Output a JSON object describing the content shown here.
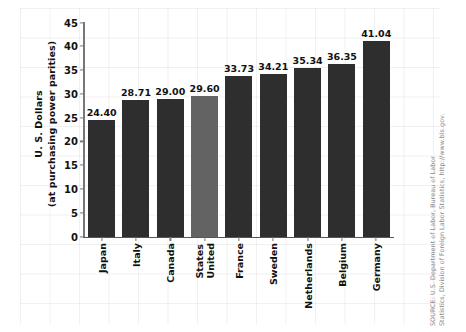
{
  "chart_data": {
    "type": "bar",
    "title": "",
    "xlabel": "",
    "ylabel": "U. S. Dollars (at purchasing power parities)",
    "ylabel_line1": "U. S. Dollars",
    "ylabel_line2": "(at purchasing power parities)",
    "categories": [
      "Japan",
      "Italy",
      "Canada",
      "United States",
      "France",
      "Sweden",
      "Netherlands",
      "Belgium",
      "Germany"
    ],
    "category_lines": [
      [
        "Japan"
      ],
      [
        "Italy"
      ],
      [
        "Canada"
      ],
      [
        "United",
        "States"
      ],
      [
        "France"
      ],
      [
        "Sweden"
      ],
      [
        "Netherlands"
      ],
      [
        "Belgium"
      ],
      [
        "Germany"
      ]
    ],
    "values": [
      24.4,
      28.71,
      29.0,
      29.6,
      33.73,
      34.21,
      35.34,
      36.35,
      41.04
    ],
    "value_labels": [
      "24.40",
      "28.71",
      "29.00",
      "29.60",
      "33.73",
      "34.21",
      "35.34",
      "36.35",
      "41.04"
    ],
    "ylim": [
      0,
      45
    ],
    "yticks": [
      0,
      5,
      10,
      15,
      20,
      25,
      30,
      35,
      40,
      45
    ],
    "ytick_labels": [
      "0",
      "5",
      "10",
      "15",
      "20",
      "25",
      "30",
      "35",
      "40",
      "45"
    ],
    "grid": true,
    "legend": "none",
    "bar_color": "#2e2e2e",
    "highlight_color": "#636363",
    "highlight_index": 3
  },
  "source": {
    "line1": "SOURCE: U.S. Department of Labor, Bureau of Labor",
    "line2": "Statistics, Division of Foreign Labor Statistics, http://www.bls.gov."
  }
}
